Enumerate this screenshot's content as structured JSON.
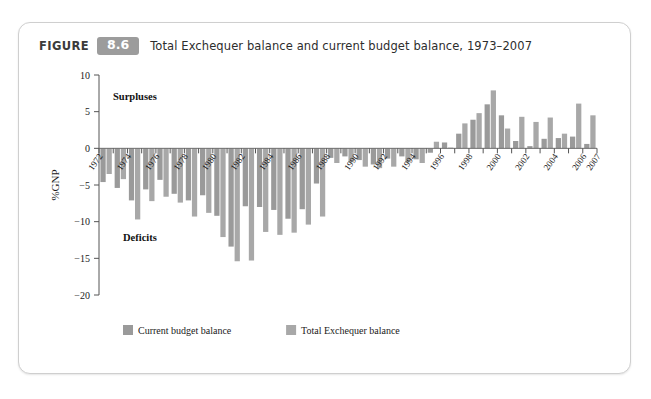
{
  "figure": {
    "label": "FIGURE",
    "number": "8.6",
    "title": "Total Exchequer balance and current budget balance, 1973–2007"
  },
  "colors": {
    "bar_current": "#9a9a9a",
    "bar_total": "#a8a8a8",
    "axis": "#555555",
    "badge": "#9c9c9c",
    "card_border": "#cfcfcf",
    "text": "#1a1a1a"
  },
  "annotations": {
    "surpluses": "Surpluses",
    "deficits": "Deficits"
  },
  "legend": {
    "items": [
      {
        "label": "Current budget balance",
        "color": "#9a9a9a"
      },
      {
        "label": "Total Exchequer balance",
        "color": "#a8a8a8"
      }
    ]
  },
  "chart_data": {
    "type": "bar",
    "title": "Total Exchequer balance and current budget balance, 1973–2007",
    "xlabel": "",
    "ylabel": "%GNP",
    "ylim": [
      -20,
      10
    ],
    "yticks": [
      10,
      5,
      0,
      -5,
      -10,
      -15,
      -20
    ],
    "ytick_labels": [
      "10",
      "5",
      "0",
      "−5",
      "−10",
      "−15",
      "−20"
    ],
    "grid": false,
    "legend_position": "bottom-left",
    "categories": [
      1973,
      1974,
      1975,
      1976,
      1977,
      1978,
      1979,
      1980,
      1981,
      1982,
      1983,
      1984,
      1985,
      1986,
      1987,
      1988,
      1989,
      1990,
      1991,
      1992,
      1993,
      1994,
      1995,
      1996,
      1997,
      1998,
      1999,
      2000,
      2001,
      2002,
      2003,
      2004,
      2005,
      2006,
      2007
    ],
    "xtick_labels": [
      "1972",
      "1974",
      "1976",
      "1978",
      "1980",
      "1982",
      "1984",
      "1986",
      "1988",
      "1990",
      "1992",
      "1994",
      "1996",
      "1998",
      "2000",
      "2002",
      "2004",
      "2006",
      "2007"
    ],
    "series": [
      {
        "name": "Current budget balance",
        "color": "#9a9a9a",
        "values": [
          -4.6,
          -5.4,
          -7.1,
          -5.6,
          -4.3,
          -6.2,
          -7.1,
          -6.4,
          -9.2,
          -13.4,
          -7.9,
          -8.0,
          -8.4,
          -9.6,
          -8.3,
          -4.8,
          -1.3,
          -1.1,
          -1.6,
          -2.2,
          -1.4,
          -1.1,
          -1.5,
          -0.6,
          0.8,
          2.0,
          3.9,
          6.0,
          4.5,
          1.0,
          0.3,
          1.3,
          1.4,
          1.6,
          0.6
        ]
      },
      {
        "name": "Total Exchequer balance",
        "color": "#a8a8a8",
        "values": [
          -3.5,
          -4.2,
          -9.7,
          -7.2,
          -6.6,
          -7.4,
          -9.3,
          -8.8,
          -12.1,
          -15.4,
          -15.3,
          -11.4,
          -11.8,
          -11.5,
          -10.4,
          -9.3,
          -2.0,
          -1.9,
          -2.5,
          -2.7,
          -2.5,
          -1.9,
          -2.0,
          0.9,
          0.1,
          3.4,
          4.8,
          7.9,
          2.7,
          4.3,
          3.6,
          4.2,
          2.0,
          6.1,
          4.5
        ]
      }
    ]
  }
}
